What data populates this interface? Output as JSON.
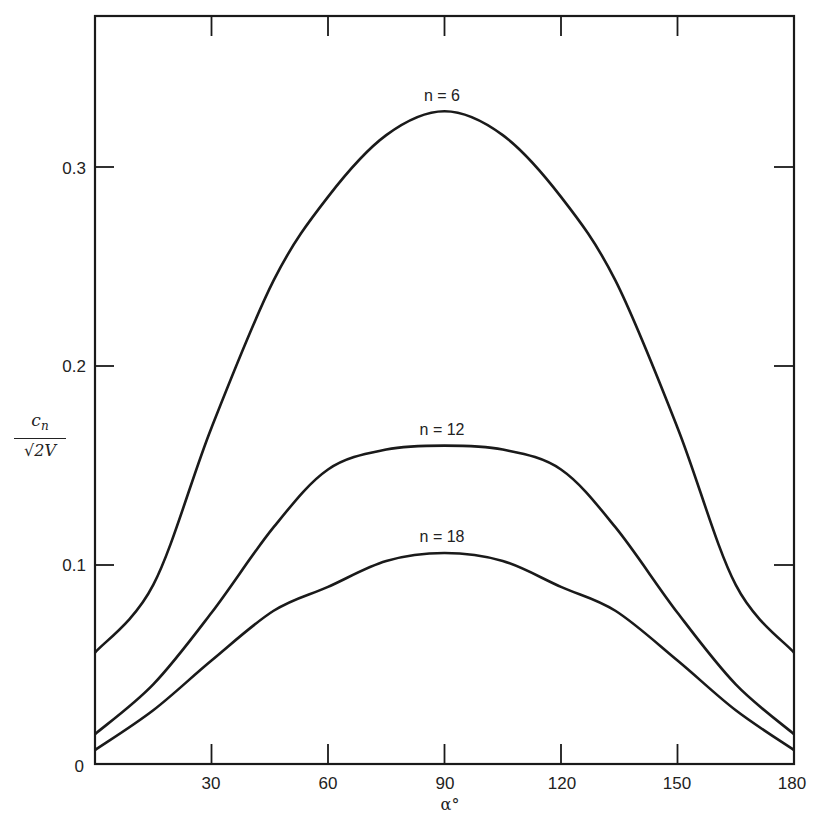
{
  "chart_data": {
    "type": "line",
    "title": "",
    "xlabel": "α°",
    "ylabel": "c_n / √2V",
    "ylabel_parts": {
      "numerator": "c",
      "numerator_sub": "n",
      "denominator": "√2V"
    },
    "xlim": [
      0,
      180
    ],
    "ylim": [
      0,
      0.3
    ],
    "x_ticks": [
      30,
      60,
      90,
      120,
      150,
      180
    ],
    "y_ticks": [
      0,
      0.1,
      0.2,
      0.3
    ],
    "x_tick_labels": [
      "30",
      "60",
      "90",
      "120",
      "150",
      "180"
    ],
    "y_tick_labels": [
      "0",
      "0.1",
      "0.2",
      "0.3"
    ],
    "grid": false,
    "legend": "inline labels above each curve peak",
    "x": [
      0,
      15,
      30,
      46,
      60,
      75,
      90,
      105,
      120,
      134,
      150,
      165,
      180
    ],
    "series": [
      {
        "name": "n = 6",
        "label": "n = 6",
        "values": [
          0.056,
          0.09,
          0.169,
          0.243,
          0.285,
          0.316,
          0.328,
          0.316,
          0.285,
          0.243,
          0.169,
          0.09,
          0.056
        ]
      },
      {
        "name": "n = 12",
        "label": "n = 12",
        "values": [
          0.015,
          0.04,
          0.076,
          0.119,
          0.148,
          0.158,
          0.16,
          0.158,
          0.148,
          0.119,
          0.076,
          0.04,
          0.015
        ]
      },
      {
        "name": "n = 18",
        "label": "n = 18",
        "values": [
          0.007,
          0.027,
          0.052,
          0.077,
          0.089,
          0.102,
          0.106,
          0.102,
          0.089,
          0.077,
          0.052,
          0.027,
          0.007
        ]
      }
    ]
  },
  "labels": {
    "zero": "0",
    "y01": "0.1",
    "y02": "0.2",
    "y03": "0.3",
    "x30": "30",
    "x60": "60",
    "x90": "90",
    "x120": "120",
    "x150": "150",
    "x180": "180",
    "curve_n6": "n = 6",
    "curve_n12": "n = 12",
    "curve_n18": "n = 18",
    "ylabel_num": "c",
    "ylabel_sub": "n",
    "ylabel_den": "√2V",
    "xlabel": "α°"
  },
  "colors": {
    "line": "#1a1a1a",
    "text": "#222222",
    "background": "#ffffff"
  }
}
